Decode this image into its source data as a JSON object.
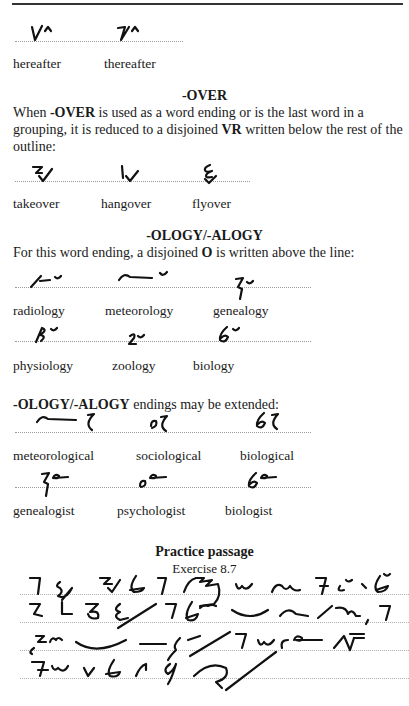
{
  "page": {
    "examples_after": {
      "words": [
        "hereafter",
        "thereafter"
      ]
    },
    "over_section": {
      "heading": "-OVER",
      "para_part1": "When ",
      "para_bold1": "-OVER",
      "para_part2": " is used as a word ending or is the last word in a grouping, it is reduced to a disjoined ",
      "para_bold2": "VR",
      "para_part3": " written below the rest of the outline:",
      "words": [
        "takeover",
        "hangover",
        "flyover"
      ]
    },
    "ology_section": {
      "heading": "-OLOGY/-ALOGY",
      "intro": "For this word ending, a disjoined O is written above the line:",
      "intro_part1": "For this word ending, a disjoined ",
      "intro_bold": "O",
      "intro_part2": " is written above the line:",
      "row1": [
        "radiology",
        "meteorology",
        "genealogy"
      ],
      "row2": [
        "physiology",
        "zoology",
        "biology"
      ]
    },
    "extended_section": {
      "intro_bold": "-OLOGY/-ALOGY",
      "intro_rest": " endings may be extended:",
      "row1": [
        "meteorological",
        "sociological",
        "biological"
      ],
      "row2": [
        "genealogist",
        "psychologist",
        "biologist"
      ]
    },
    "practice": {
      "title": "Practice passage",
      "subtitle": "Exercise 8.7",
      "line_count": 4
    }
  }
}
